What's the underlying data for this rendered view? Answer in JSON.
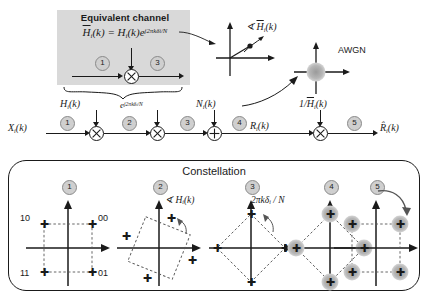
{
  "equivalent_channel": {
    "title": "Equivalent channel",
    "formula_lhs": "H",
    "formula_lhs_sub": "i",
    "formula": "H̄ᵢ(k) = Hᵢ(k)e^{j2πkδᵢ/N}",
    "stage_in": "1",
    "stage_out": "3"
  },
  "phase_plot": {
    "label": "∠ H̄ᵢ(k)"
  },
  "awgn": {
    "label": "AWGN"
  },
  "chain": {
    "input_label": "Xᵢ(k)",
    "output_label": "R̂ᵢ(k)",
    "mid_label": "Rᵢ(k)",
    "taps": [
      {
        "label": "Hᵢ(k)",
        "op": "multiply"
      },
      {
        "label": "e^{j2πkδᵢ/N}",
        "op": "multiply"
      },
      {
        "label": "Nᵢ(k)",
        "op": "add"
      },
      {
        "label": "1/H̄ᵢ(k)",
        "op": "multiply"
      }
    ],
    "stages": [
      "1",
      "2",
      "3",
      "4",
      "5"
    ]
  },
  "constellation": {
    "title": "Constellation",
    "stage_numbers": [
      "1",
      "2",
      "3",
      "4",
      "5"
    ],
    "bit_labels": {
      "top_left": "10",
      "top_right": "00",
      "bottom_left": "11",
      "bottom_right": "01"
    },
    "annotations": {
      "stage2": "∠ Hᵢ(k)",
      "stage3": "2πkδᵢ / N"
    },
    "panels": [
      {
        "id": "1",
        "rotation_deg": 0,
        "noisy": false,
        "marker": "plus"
      },
      {
        "id": "2",
        "rotation_deg": 22,
        "noisy": false,
        "marker": "plus"
      },
      {
        "id": "3",
        "rotation_deg": 45,
        "noisy": false,
        "marker": "plus"
      },
      {
        "id": "4",
        "rotation_deg": 45,
        "noisy": true,
        "marker": "plus"
      },
      {
        "id": "5",
        "rotation_deg": 0,
        "noisy": true,
        "marker": "plus"
      }
    ]
  },
  "colors": {
    "panel_gray": "#d9d9d9",
    "stage_gray": "#cfcfcf",
    "line": "#1a1a1a",
    "blob": "#b6b6b6"
  }
}
